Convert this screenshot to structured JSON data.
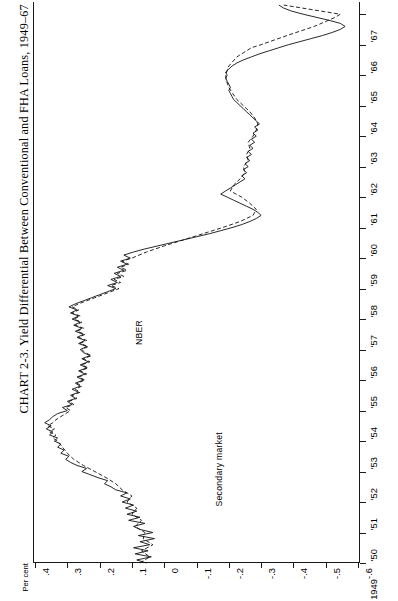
{
  "figure": {
    "title": "CHART 2-3. Yield Differential Between Conventional and FHA Loans, 1949–67",
    "unit_label": "Per cent"
  },
  "annotations": [
    {
      "name": "nber",
      "text": "NBER"
    },
    {
      "name": "secondary",
      "text": "Secondary market"
    }
  ],
  "chart_data": {
    "type": "line",
    "title": "CHART 2-3. Yield Differential Between Conventional and FHA Loans, 1949–67",
    "orientation": "value-axis-horizontal, time-axis-vertical-upward",
    "xlabel": "Per cent",
    "ylabel": "",
    "grid": false,
    "legend_position": "in-plot annotations",
    "value_axis": {
      "label": "Per cent",
      "ticks": [
        0.4,
        0.3,
        0.2,
        0.1,
        0.0,
        -0.1,
        -0.2,
        -0.3,
        -0.4,
        -0.5,
        -0.6
      ],
      "tick_labels": [
        ".4",
        ".3",
        ".2",
        ".1",
        "0",
        "-.1",
        "-.2",
        "-.3",
        "-.4",
        "-.5",
        "-.6"
      ],
      "lim": [
        0.4,
        -0.6
      ]
    },
    "time_axis": {
      "ticks": [
        1949,
        1950,
        1951,
        1952,
        1953,
        1954,
        1955,
        1956,
        1957,
        1958,
        1959,
        1960,
        1961,
        1962,
        1963,
        1964,
        1965,
        1966,
        1967
      ],
      "tick_labels": [
        "1949",
        "'50",
        "'51",
        "'52",
        "'53",
        "'54",
        "'55",
        "'56",
        "'57",
        "'58",
        "'59",
        "'60",
        "'61",
        "'62",
        "'63",
        "'64",
        "'65",
        "'66",
        "'67"
      ],
      "lim": [
        1949,
        1967.4
      ]
    },
    "series": [
      {
        "name": "NBER",
        "style": "solid",
        "t": [
          1949.0,
          1949.1,
          1949.2,
          1949.3,
          1949.4,
          1949.5,
          1949.6,
          1949.7,
          1949.8,
          1949.9,
          1950.0,
          1950.1,
          1950.2,
          1950.3,
          1950.4,
          1950.5,
          1950.6,
          1950.7,
          1950.8,
          1950.9,
          1951.0,
          1951.1,
          1951.2,
          1951.3,
          1951.4,
          1951.5,
          1951.6,
          1951.7,
          1951.8,
          1951.9,
          1952.0,
          1952.1,
          1952.2,
          1952.3,
          1952.4,
          1952.5,
          1952.6,
          1952.7,
          1952.8,
          1952.9,
          1953.0,
          1953.1,
          1953.2,
          1953.3,
          1953.4,
          1953.5,
          1953.6,
          1953.7,
          1953.8,
          1953.9,
          1954.0,
          1954.1,
          1954.2,
          1954.3,
          1954.4,
          1954.5,
          1954.6,
          1954.7,
          1954.8,
          1954.9,
          1955.0,
          1955.1,
          1955.2,
          1955.3,
          1955.4,
          1955.5,
          1955.6,
          1955.7,
          1955.8,
          1955.9,
          1956.0,
          1956.1,
          1956.2,
          1956.3,
          1956.4,
          1956.5,
          1956.6,
          1956.7,
          1956.8,
          1956.9,
          1957.0,
          1957.1,
          1957.2,
          1957.3,
          1957.4,
          1957.5,
          1957.6,
          1957.7,
          1957.8,
          1957.9,
          1958.0,
          1958.1,
          1958.2,
          1958.3,
          1958.4,
          1958.5,
          1958.6,
          1958.7,
          1958.8,
          1958.9,
          1959.0,
          1959.1,
          1959.2,
          1959.3,
          1959.4,
          1959.5,
          1959.6,
          1959.7,
          1959.8,
          1959.9,
          1960.0,
          1960.1,
          1960.2,
          1960.3,
          1960.4,
          1960.5,
          1960.6,
          1960.7,
          1960.8,
          1960.9,
          1961.0,
          1961.1,
          1961.2,
          1961.3,
          1961.4,
          1961.5,
          1961.6,
          1961.7,
          1961.8,
          1961.9,
          1962.0,
          1962.1,
          1962.2,
          1962.3,
          1962.4,
          1962.5,
          1962.6,
          1962.7,
          1962.8,
          1962.9,
          1963.0,
          1963.1,
          1963.2,
          1963.3,
          1963.4,
          1963.5,
          1963.6,
          1963.7,
          1963.8,
          1963.9,
          1964.0,
          1964.1,
          1964.2,
          1964.3,
          1964.4,
          1964.5,
          1964.6,
          1964.7,
          1964.8,
          1964.9,
          1965.0,
          1965.1,
          1965.2,
          1965.3,
          1965.4,
          1965.5,
          1965.6,
          1965.7,
          1965.8,
          1965.9,
          1966.0,
          1966.1,
          1966.2,
          1966.3,
          1966.4,
          1966.5,
          1966.6,
          1966.7,
          1966.8,
          1966.9,
          1967.0,
          1967.1,
          1967.2,
          1967.3
        ],
        "v": [
          0.055,
          0.085,
          0.04,
          0.09,
          0.05,
          0.095,
          0.045,
          0.075,
          0.03,
          0.08,
          0.035,
          0.075,
          0.095,
          0.06,
          0.11,
          0.075,
          0.115,
          0.085,
          0.12,
          0.095,
          0.13,
          0.105,
          0.135,
          0.115,
          0.15,
          0.165,
          0.185,
          0.175,
          0.205,
          0.23,
          0.255,
          0.24,
          0.27,
          0.29,
          0.305,
          0.295,
          0.32,
          0.31,
          0.33,
          0.32,
          0.34,
          0.33,
          0.355,
          0.345,
          0.365,
          0.35,
          0.37,
          0.355,
          0.345,
          0.33,
          0.3,
          0.315,
          0.285,
          0.3,
          0.275,
          0.29,
          0.265,
          0.285,
          0.26,
          0.275,
          0.25,
          0.27,
          0.245,
          0.265,
          0.24,
          0.26,
          0.235,
          0.255,
          0.23,
          0.25,
          0.26,
          0.24,
          0.265,
          0.245,
          0.27,
          0.25,
          0.275,
          0.255,
          0.28,
          0.26,
          0.285,
          0.265,
          0.29,
          0.27,
          0.295,
          0.275,
          0.25,
          0.225,
          0.2,
          0.175,
          0.15,
          0.175,
          0.145,
          0.165,
          0.135,
          0.155,
          0.125,
          0.145,
          0.115,
          0.135,
          0.105,
          0.125,
          0.095,
          0.06,
          0.02,
          -0.02,
          -0.06,
          -0.1,
          -0.14,
          -0.175,
          -0.21,
          -0.24,
          -0.265,
          -0.285,
          -0.3,
          -0.29,
          -0.275,
          -0.255,
          -0.235,
          -0.215,
          -0.195,
          -0.175,
          -0.19,
          -0.205,
          -0.22,
          -0.235,
          -0.25,
          -0.24,
          -0.255,
          -0.245,
          -0.26,
          -0.25,
          -0.265,
          -0.255,
          -0.27,
          -0.26,
          -0.275,
          -0.265,
          -0.28,
          -0.27,
          -0.285,
          -0.275,
          -0.29,
          -0.28,
          -0.295,
          -0.285,
          -0.275,
          -0.265,
          -0.255,
          -0.245,
          -0.235,
          -0.225,
          -0.215,
          -0.21,
          -0.205,
          -0.2,
          -0.205,
          -0.2,
          -0.195,
          -0.19,
          -0.195,
          -0.19,
          -0.2,
          -0.21,
          -0.225,
          -0.245,
          -0.27,
          -0.295,
          -0.325,
          -0.355,
          -0.385,
          -0.42,
          -0.455,
          -0.49,
          -0.52,
          -0.545,
          -0.56,
          -0.545,
          -0.51,
          -0.47,
          -0.43,
          -0.395,
          -0.37,
          -0.355
        ]
      },
      {
        "name": "Secondary market",
        "style": "dashed",
        "t": [
          1949.0,
          1949.2,
          1949.4,
          1949.6,
          1949.8,
          1950.0,
          1950.2,
          1950.4,
          1950.6,
          1950.8,
          1951.0,
          1951.2,
          1951.4,
          1951.6,
          1951.8,
          1952.0,
          1952.2,
          1952.4,
          1952.6,
          1952.8,
          1953.0,
          1953.1,
          1953.2,
          1953.3,
          1953.4,
          1953.5,
          1953.6,
          1953.7,
          1953.8,
          1953.9,
          1954.0,
          1954.1,
          1954.2,
          1954.3,
          1954.4,
          1954.5,
          1954.6,
          1954.7,
          1954.8,
          1954.9,
          1955.0,
          1955.1,
          1955.2,
          1955.3,
          1955.4,
          1955.5,
          1955.6,
          1955.7,
          1955.8,
          1955.9,
          1956.0,
          1956.1,
          1956.2,
          1956.3,
          1956.4,
          1956.5,
          1956.6,
          1956.7,
          1956.8,
          1956.9,
          1957.0,
          1957.1,
          1957.2,
          1957.3,
          1957.4,
          1957.5,
          1957.6,
          1957.7,
          1957.8,
          1957.9,
          1958.0,
          1958.1,
          1958.2,
          1958.3,
          1958.4,
          1958.5,
          1958.6,
          1958.7,
          1958.8,
          1958.9,
          1959.0,
          1959.2,
          1959.4,
          1959.6,
          1959.8,
          1960.0,
          1960.2,
          1960.4,
          1960.6,
          1960.8,
          1961.0,
          1961.2,
          1961.4,
          1961.6,
          1961.8,
          1962.0,
          1962.2,
          1962.4,
          1962.6,
          1962.8,
          1963.0,
          1963.2,
          1963.4,
          1963.6,
          1963.8,
          1964.0,
          1964.2,
          1964.4,
          1964.6,
          1964.8,
          1965.0,
          1965.3,
          1965.6,
          1965.9,
          1966.0,
          1966.3,
          1966.6,
          1966.9,
          1967.0,
          1967.3
        ],
        "v": [
          0.075,
          0.045,
          0.07,
          0.035,
          0.065,
          0.06,
          0.09,
          0.07,
          0.1,
          0.085,
          0.115,
          0.1,
          0.13,
          0.15,
          0.18,
          0.215,
          0.25,
          0.28,
          0.3,
          0.315,
          0.33,
          0.345,
          0.335,
          0.355,
          0.34,
          0.36,
          0.345,
          0.335,
          0.32,
          0.305,
          0.29,
          0.305,
          0.28,
          0.295,
          0.27,
          0.285,
          0.26,
          0.275,
          0.255,
          0.27,
          0.245,
          0.265,
          0.24,
          0.26,
          0.235,
          0.255,
          0.23,
          0.25,
          0.225,
          0.245,
          0.255,
          0.235,
          0.26,
          0.24,
          0.265,
          0.245,
          0.27,
          0.25,
          0.275,
          0.255,
          0.28,
          0.26,
          0.285,
          0.265,
          0.285,
          0.265,
          0.24,
          0.215,
          0.19,
          0.165,
          0.14,
          0.165,
          0.135,
          0.155,
          0.125,
          0.145,
          0.115,
          0.135,
          0.11,
          0.13,
          0.1,
          0.055,
          0.0,
          -0.06,
          -0.12,
          -0.18,
          -0.235,
          -0.275,
          -0.285,
          -0.265,
          -0.24,
          -0.205,
          -0.215,
          -0.235,
          -0.25,
          -0.245,
          -0.26,
          -0.255,
          -0.265,
          -0.26,
          -0.275,
          -0.285,
          -0.29,
          -0.28,
          -0.265,
          -0.245,
          -0.225,
          -0.212,
          -0.2,
          -0.193,
          -0.19,
          -0.2,
          -0.225,
          -0.27,
          -0.3,
          -0.38,
          -0.465,
          -0.53,
          -0.545,
          -0.37
        ]
      }
    ]
  }
}
